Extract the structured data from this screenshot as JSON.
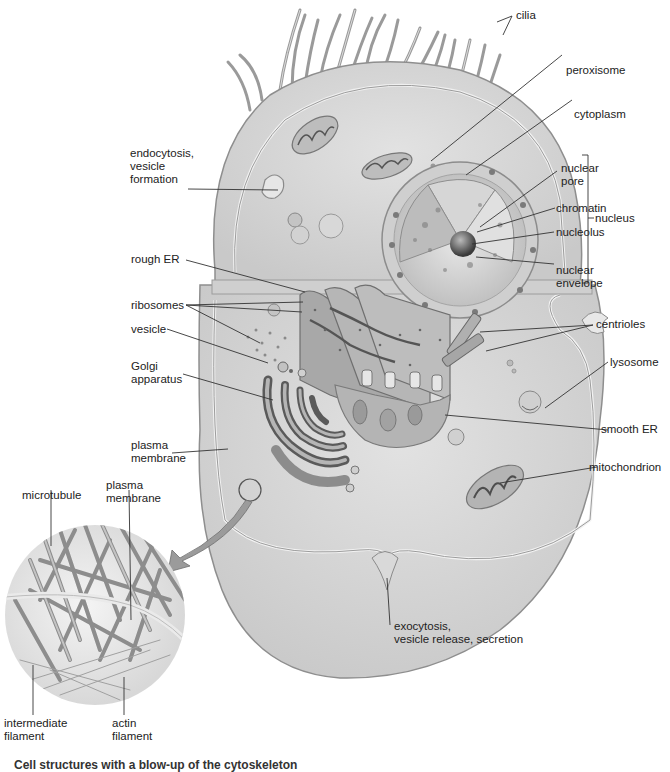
{
  "diagram": {
    "type": "animal-cell-cross-section",
    "colors": {
      "cytoplasm": "#d9d9d9",
      "membrane_highlight": "#f2f2f2",
      "organelle_dark": "#6f6f6f",
      "organelle_mid": "#a9a9a9",
      "label_text": "#222222",
      "leader_line": "#333333",
      "background": "#ffffff"
    },
    "labels": {
      "cilia": "cilia",
      "peroxisome": "peroxisome",
      "cytoplasm": "cytoplasm",
      "endocytosis": "endocytosis,\nvesicle\nformation",
      "nuclear_pore": "nuclear\npore",
      "chromatin": "chromatin",
      "nucleolus": "nucleolus",
      "nuclear_envelope": "nuclear\nenvelope",
      "nucleus": "nucleus",
      "rough_er": "rough ER",
      "ribosomes": "ribosomes",
      "vesicle": "vesicle",
      "golgi": "Golgi\napparatus",
      "centrioles": "centrioles",
      "lysosome": "lysosome",
      "plasma_membrane": "plasma\nmembrane",
      "smooth_er": "smooth ER",
      "mitochondrion": "mitochondrion",
      "exocytosis": "exocytosis,\nvesicle release, secretion"
    },
    "inset": {
      "title": "cytoskeleton",
      "labels": {
        "microtubule": "microtubule",
        "plasma_membrane": "plasma\nmembrane",
        "intermediate_filament": "intermediate\nfilament",
        "actin_filament": "actin\nfilament"
      }
    },
    "caption": "Cell structures with a blow-up of the cytoskeleton"
  }
}
